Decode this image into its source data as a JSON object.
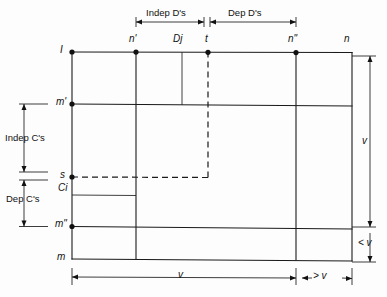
{
  "diagram": {
    "top_labels": {
      "indep_d": "Indep D's",
      "dep_d": "Dep D's"
    },
    "column_labels": {
      "n_prime": "n'",
      "dj": "Dj",
      "t": "t",
      "n_double_prime": "n\"",
      "n": "n"
    },
    "row_labels": {
      "i": "I",
      "m_prime": "m'",
      "s": "s",
      "ci": "Ci",
      "m_double_prime": "m\"",
      "m": "m"
    },
    "side_labels": {
      "indep_c": "Indep C's",
      "dep_c": "Dep C's"
    },
    "dimension_labels": {
      "right_tall": "v",
      "right_short": "< v",
      "bottom_wide": "v",
      "bottom_narrow": "> v"
    },
    "colors": {
      "line": "#1a1a1a",
      "background": "#fdfdfd",
      "node": "#111111"
    }
  }
}
